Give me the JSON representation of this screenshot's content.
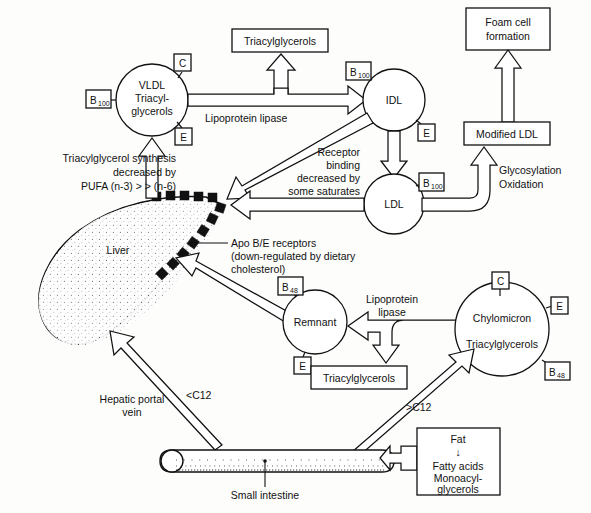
{
  "diagram": {
    "background_color": "#fdfdfc",
    "line_color": "#111111"
  },
  "nodes": {
    "vldl": {
      "line1": "VLDL",
      "line2": "Triacyl-",
      "line3": "glycerols"
    },
    "idl": {
      "label": "IDL"
    },
    "ldl": {
      "label": "LDL"
    },
    "remnant": {
      "label": "Remnant"
    },
    "chylomicron": {
      "line1": "Chylomicron",
      "line2": "Triacylglycerols"
    },
    "liver": {
      "label": "Liver"
    },
    "small_intestine": {
      "label": "Small intestine"
    }
  },
  "boxes": {
    "tag_top": {
      "label": "Triacylglycerols"
    },
    "foam_cell": {
      "line1": "Foam cell",
      "line2": "formation"
    },
    "modified_ldl": {
      "label": "Modified LDL"
    },
    "tag_mid": {
      "label": "Triacylglycerols"
    },
    "fat": {
      "line1": "Fat",
      "arrow": "↓",
      "line2": "Fatty acids",
      "line3": "Monoacyl-",
      "line4": "glycerols"
    }
  },
  "apo_labels": {
    "vldl_c": {
      "main": "C",
      "sub": ""
    },
    "vldl_b100": {
      "main": "B",
      "sub": "100"
    },
    "vldl_e": {
      "main": "E",
      "sub": ""
    },
    "idl_b100": {
      "main": "B",
      "sub": "100"
    },
    "idl_e": {
      "main": "E",
      "sub": ""
    },
    "ldl_b100": {
      "main": "B",
      "sub": "100"
    },
    "remnant_b48": {
      "main": "B",
      "sub": "48"
    },
    "remnant_e": {
      "main": "E",
      "sub": ""
    },
    "chylo_c": {
      "main": "C",
      "sub": ""
    },
    "chylo_e": {
      "main": "E",
      "sub": ""
    },
    "chylo_b48": {
      "main": "B",
      "sub": "48"
    }
  },
  "annotations": {
    "lipoprotein_lipase_top": {
      "label": "Lipoprotein lipase"
    },
    "lipoprotein_lipase_bottom": {
      "line1": "Lipoprotein",
      "line2": "lipase"
    },
    "tag_synthesis": {
      "line1": "Triacylglycerol synthesis",
      "line2": "decreased by",
      "line3": "PUFA (n-3) > > (n-6)"
    },
    "receptor_binding": {
      "line1": "Receptor",
      "line2": "binding",
      "line3": "decreased by",
      "line4": "some saturates"
    },
    "apo_be_receptors": {
      "line1": "Apo B/E receptors",
      "line2": "(down-regulated by dietary",
      "line3": "cholesterol)"
    },
    "glycosylation": {
      "line1": "Glycosylation",
      "line2": "Oxidation"
    },
    "hepatic_portal_vein": {
      "line1": "Hepatic portal",
      "line2": "vein"
    },
    "lt_c12": {
      "label": "<C12"
    },
    "gt_c12": {
      "label": ">C12"
    }
  }
}
